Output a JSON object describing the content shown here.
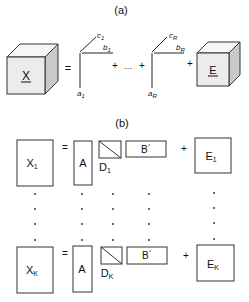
{
  "panel_a": {
    "label": "(a)",
    "tensor_X": "X",
    "equals": "=",
    "triad_1": {
      "a": "a",
      "a_sub": "1",
      "b": "b",
      "b_sub": "1",
      "c": "c",
      "c_sub": "1"
    },
    "plus_1": "+",
    "ellipsis": "…",
    "plus_2": "+",
    "triad_R": {
      "a": "a",
      "a_sub": "R",
      "b": "b",
      "b_sub": "R",
      "c": "c",
      "c_sub": "R"
    },
    "plus_3": "+",
    "tensor_E": "E"
  },
  "panel_b": {
    "label": "(b)",
    "rows": [
      {
        "X": "X",
        "X_sub": "1",
        "equals": "=",
        "A": "A",
        "D": "D",
        "D_sub": "1",
        "B": "B´",
        "plus": "+",
        "E": "E",
        "E_sub": "1"
      },
      {
        "X": "X",
        "X_sub": "K",
        "equals": "=",
        "A": "A",
        "D": "D",
        "D_sub": "K",
        "B": "B´",
        "plus": "+",
        "E": "E",
        "E_sub": "K"
      }
    ],
    "dot_columns": [
      "X",
      "A",
      "D",
      "B",
      "E"
    ],
    "dots_per_column": 4
  }
}
